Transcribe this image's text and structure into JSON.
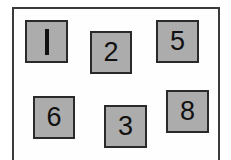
{
  "page": {
    "background_color": "#ffffff",
    "width": 231,
    "height": 160
  },
  "frame": {
    "name": "outer-frame",
    "border_color": "#3a3a3a",
    "border_width": 2,
    "fill_color": "#fefefe",
    "x": 12,
    "y": 7,
    "width": 208,
    "height": 162
  },
  "tiles": {
    "fill_color": "#acacac",
    "border_color": "#2a2a2a",
    "text_color": "#111111",
    "items": [
      {
        "label": "1",
        "x": 25,
        "y": 20,
        "width": 43,
        "height": 43,
        "glyph_style": "stroke"
      },
      {
        "label": "2",
        "x": 90,
        "y": 31,
        "width": 42,
        "height": 43,
        "glyph_style": "text"
      },
      {
        "label": "5",
        "x": 156,
        "y": 20,
        "width": 43,
        "height": 43,
        "glyph_style": "text"
      },
      {
        "label": "6",
        "x": 33,
        "y": 96,
        "width": 42,
        "height": 43,
        "glyph_style": "text"
      },
      {
        "label": "3",
        "x": 104,
        "y": 105,
        "width": 43,
        "height": 43,
        "glyph_style": "text"
      },
      {
        "label": "8",
        "x": 166,
        "y": 90,
        "width": 43,
        "height": 43,
        "glyph_style": "text"
      }
    ]
  }
}
